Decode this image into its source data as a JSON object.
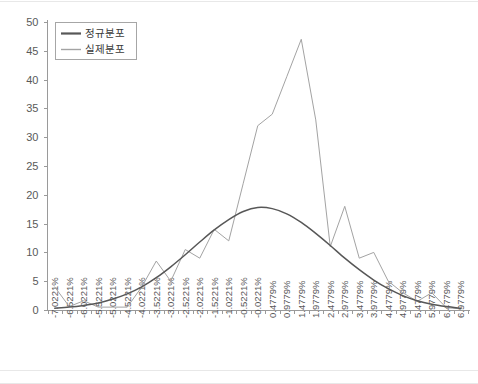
{
  "chart_data": {
    "type": "line",
    "title": "",
    "xlabel": "",
    "ylabel": "",
    "ylim": [
      0,
      50
    ],
    "y_ticks": [
      0,
      5,
      10,
      15,
      20,
      25,
      30,
      35,
      40,
      45,
      50
    ],
    "grid": false,
    "legend_position": "top-left",
    "categories": [
      "-7.0221%",
      "-6.5221%",
      "-6.0221%",
      "-5.5221%",
      "-5.0221%",
      "-4.5221%",
      "-4.0221%",
      "-3.5221%",
      "-3.0221%",
      "-2.5221%",
      "-2.0221%",
      "-1.5221%",
      "-1.0221%",
      "-0.5221%",
      "-0.0221%",
      "0.4779%",
      "0.9779%",
      "1.4779%",
      "1.9779%",
      "2.4779%",
      "2.9779%",
      "3.4779%",
      "3.9779%",
      "4.4779%",
      "4.9779%",
      "5.4779%",
      "5.9779%",
      "6.4779%",
      "6.9779%"
    ],
    "series": [
      {
        "name": "정규분포",
        "color": "#575757",
        "values": [
          0.3,
          0.5,
          0.8,
          1.2,
          1.9,
          2.8,
          4.0,
          5.6,
          7.5,
          9.6,
          11.8,
          13.9,
          15.7,
          17.1,
          17.8,
          17.6,
          16.7,
          15.2,
          13.3,
          11.2,
          9.0,
          7.0,
          5.2,
          3.7,
          2.5,
          1.6,
          1.0,
          0.6,
          0.3
        ]
      },
      {
        "name": "실제분포",
        "color": "#a3a3a3",
        "values": [
          4.0,
          0.6,
          1.6,
          0.5,
          0.5,
          0.5,
          4.0,
          8.5,
          5.0,
          10.5,
          9.0,
          14.0,
          12.0,
          22.0,
          32.0,
          34.0,
          40.5,
          47.0,
          33.0,
          11.0,
          18.0,
          9.0,
          10.0,
          5.0,
          3.0,
          1.5,
          3.0,
          0.4,
          0.2
        ]
      }
    ]
  },
  "legend": {
    "entries": [
      {
        "label": "정규분포"
      },
      {
        "label": "실제분포"
      }
    ]
  }
}
